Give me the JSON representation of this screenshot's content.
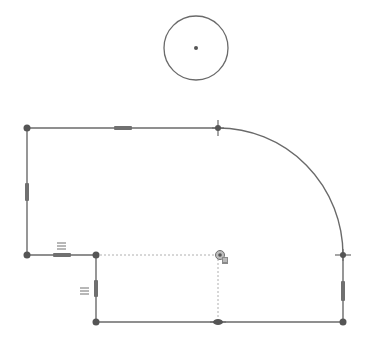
{
  "sketch": {
    "colors": {
      "geometry": "#6a6a6a",
      "construction": "#b0b0b0",
      "point": "#555555",
      "constraint": "#707070",
      "background": "#ffffff"
    },
    "circle": {
      "cx": 196,
      "cy": 48,
      "r": 32
    },
    "points": [
      {
        "id": "p-top-left",
        "x": 27,
        "y": 128,
        "kind": "endpoint"
      },
      {
        "id": "p-arc-start",
        "x": 218,
        "y": 128,
        "kind": "tangent"
      },
      {
        "id": "p-arc-end",
        "x": 343,
        "y": 255,
        "kind": "tangent"
      },
      {
        "id": "p-left-bottom",
        "x": 27,
        "y": 255,
        "kind": "endpoint"
      },
      {
        "id": "p-inner-corner",
        "x": 96,
        "y": 255,
        "kind": "endpoint"
      },
      {
        "id": "p-bottom-left",
        "x": 96,
        "y": 322,
        "kind": "endpoint"
      },
      {
        "id": "p-bottom-mid",
        "x": 218,
        "y": 322,
        "kind": "midpoint"
      },
      {
        "id": "p-bottom-right",
        "x": 343,
        "y": 322,
        "kind": "endpoint"
      }
    ],
    "constraints": {
      "equal_symbol": "=",
      "horizontal_markers": [
        {
          "x": 123,
          "y": 128
        },
        {
          "x": 62,
          "y": 255
        }
      ],
      "vertical_markers": [
        {
          "x": 27,
          "y": 192
        },
        {
          "x": 96,
          "y": 288
        },
        {
          "x": 343,
          "y": 291
        }
      ],
      "equal_labels": [
        {
          "x": 57,
          "y": 245
        },
        {
          "x": 81,
          "y": 292
        }
      ]
    },
    "cursor": {
      "x": 222,
      "y": 258
    }
  }
}
